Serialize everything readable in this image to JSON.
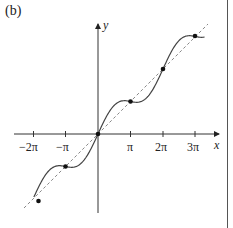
{
  "figure": {
    "panel_label": "(b)",
    "x_axis_label": "x",
    "y_axis_label": "y",
    "x_tick_labels": [
      "−2π",
      "−π",
      "π",
      "2π",
      "3π"
    ]
  },
  "chart_data": {
    "type": "line",
    "title": "",
    "panel": "(b)",
    "xlabel": "x",
    "ylabel": "y",
    "x_ticks": [
      "-2π",
      "-π",
      "π",
      "2π",
      "3π"
    ],
    "x_tick_values": [
      -6.2832,
      -3.1416,
      3.1416,
      6.2832,
      9.4248
    ],
    "xlim": [
      -8.1,
      11.9
    ],
    "ylim": [
      -7.5,
      10.7
    ],
    "grid": false,
    "legend": null,
    "series": [
      {
        "name": "curve",
        "style": "solid",
        "color": "#444444",
        "description": "wavy increasing curve crossing y = x at multiples of π (approx. y = x + 1.2 sin x)",
        "x_range": [
          -6.2,
          10.3
        ]
      },
      {
        "name": "y = x",
        "style": "dashed",
        "color": "#888888",
        "x_range": [
          -7.2,
          10.5
        ]
      }
    ],
    "points": [
      {
        "x": -6.2832,
        "y": -6.5,
        "label": "-2π"
      },
      {
        "x": -3.1416,
        "y": -3.1416,
        "label": "-π"
      },
      {
        "x": 0,
        "y": 0,
        "label": "0"
      },
      {
        "x": 3.1416,
        "y": 3.1416,
        "label": "π"
      },
      {
        "x": 6.2832,
        "y": 6.2832,
        "label": "2π"
      },
      {
        "x": 9.4248,
        "y": 9.4248,
        "label": "3π"
      }
    ]
  }
}
